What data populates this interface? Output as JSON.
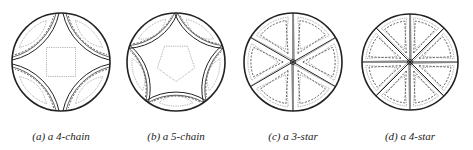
{
  "figure": {
    "panels": [
      {
        "id": "a",
        "caption": "(a) a 4-chain",
        "type": "chain",
        "n": 4,
        "cx": 61,
        "cy": 62,
        "r": 49
      },
      {
        "id": "b",
        "caption": "(b) a 5-chain",
        "type": "chain",
        "n": 5,
        "cx": 176,
        "cy": 62,
        "r": 49
      },
      {
        "id": "c",
        "caption": "(c) a 3-star",
        "type": "star",
        "n": 3,
        "cx": 293,
        "cy": 62,
        "r": 49
      },
      {
        "id": "d",
        "caption": "(d) a 4-star",
        "type": "star",
        "n": 4,
        "cx": 410,
        "cy": 62,
        "r": 48
      }
    ],
    "colors": {
      "outline": "#222222",
      "dashed": "#333333",
      "dotted": "#777777"
    }
  }
}
